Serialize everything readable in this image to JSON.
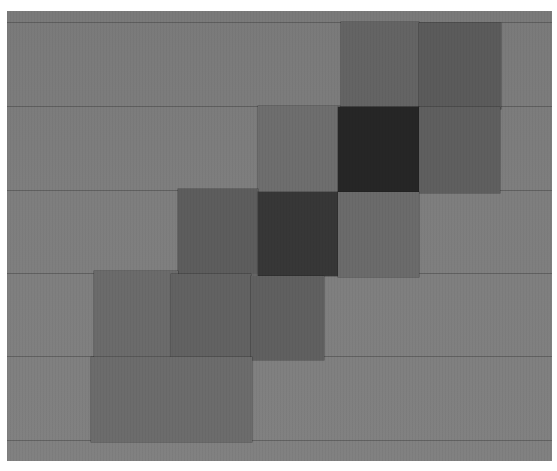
{
  "image": {
    "description": "Abstract collage of overlapping gray paper squares arranged diagonally on a gray grid background",
    "background_color": "#7c7c7c"
  },
  "grid_lines_y": [
    11,
    95,
    179,
    262,
    345,
    429
  ],
  "squares": [
    {
      "id": "r1c5",
      "x": 334,
      "y": 11,
      "w": 78,
      "h": 84,
      "color": "#646464"
    },
    {
      "id": "r1c6",
      "x": 412,
      "y": 12,
      "w": 82,
      "h": 86,
      "color": "#5b5b5b"
    },
    {
      "id": "r2c4",
      "x": 251,
      "y": 95,
      "w": 82,
      "h": 86,
      "color": "#6e6e6e"
    },
    {
      "id": "r2c5",
      "x": 331,
      "y": 96,
      "w": 81,
      "h": 85,
      "color": "#262626"
    },
    {
      "id": "r2c6",
      "x": 412,
      "y": 96,
      "w": 81,
      "h": 86,
      "color": "#5f5f5f"
    },
    {
      "id": "r3c3",
      "x": 171,
      "y": 178,
      "w": 80,
      "h": 85,
      "color": "#5d5d5d"
    },
    {
      "id": "r3c4",
      "x": 251,
      "y": 181,
      "w": 80,
      "h": 84,
      "color": "#373737"
    },
    {
      "id": "r3c5",
      "x": 331,
      "y": 181,
      "w": 81,
      "h": 85,
      "color": "#6b6b6b"
    },
    {
      "id": "r4c2",
      "x": 87,
      "y": 260,
      "w": 84,
      "h": 86,
      "color": "#6b6b6b"
    },
    {
      "id": "r4c3",
      "x": 164,
      "y": 263,
      "w": 80,
      "h": 86,
      "color": "#626262"
    },
    {
      "id": "r4c4",
      "x": 244,
      "y": 265,
      "w": 73,
      "h": 84,
      "color": "#606060"
    },
    {
      "id": "r5c2",
      "x": 84,
      "y": 346,
      "w": 161,
      "h": 85,
      "color": "#6c6c6c"
    }
  ]
}
